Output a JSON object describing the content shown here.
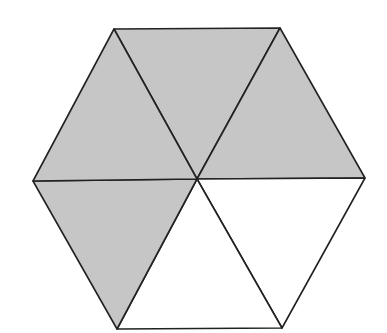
{
  "diagram": {
    "shape": "regular hexagon divided into 6 equilateral triangles",
    "shaded_count": 4,
    "unshaded_count": 2,
    "colors": {
      "shaded": "#c6c6c6",
      "unshaded": "#ffffff",
      "stroke": "#222222"
    },
    "vertices": {
      "top_left": [
        114,
        29
      ],
      "top_right": [
        280,
        28
      ],
      "right": [
        365,
        178
      ],
      "bottom_right": [
        282,
        328
      ],
      "bottom_left": [
        117,
        329
      ],
      "left": [
        33,
        181
      ],
      "center": [
        197,
        179
      ]
    },
    "triangles": [
      {
        "id": "top",
        "shaded": true
      },
      {
        "id": "upper-right",
        "shaded": true
      },
      {
        "id": "lower-right",
        "shaded": false
      },
      {
        "id": "bottom",
        "shaded": false
      },
      {
        "id": "lower-left",
        "shaded": true
      },
      {
        "id": "upper-left",
        "shaded": true
      }
    ]
  }
}
